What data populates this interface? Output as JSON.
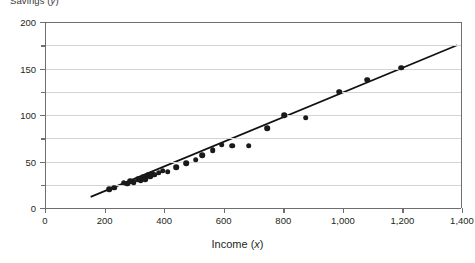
{
  "chart_data": {
    "type": "scatter",
    "title": "Savings (y)",
    "xlabel": "Income",
    "xlabel_var": "x",
    "ylabel": "Savings",
    "ylabel_var": "y",
    "xlim": [
      0,
      1400
    ],
    "ylim": [
      0,
      200
    ],
    "xticks": [
      0,
      200,
      400,
      600,
      800,
      1000,
      1200,
      1400
    ],
    "xticklabels": [
      "0",
      "200",
      "400",
      "600",
      "800",
      "1,000",
      "1,200",
      "1,400"
    ],
    "yticks": [
      0,
      50,
      100,
      150,
      200
    ],
    "yticklabels": [
      "0",
      "50",
      "100",
      "150",
      "200"
    ],
    "yminorticks": [
      25,
      75,
      125,
      175
    ],
    "grid": true,
    "grid_interval": 25,
    "legend": null,
    "marker_color": "#1a1a1a",
    "line_color": "#111111",
    "grid_color": "#d4d4d4",
    "axis_color": "#6f6f6f",
    "points": [
      {
        "x": 213,
        "y": 20
      },
      {
        "x": 228,
        "y": 22
      },
      {
        "x": 261,
        "y": 27
      },
      {
        "x": 272,
        "y": 26
      },
      {
        "x": 283,
        "y": 29
      },
      {
        "x": 295,
        "y": 28
      },
      {
        "x": 308,
        "y": 31
      },
      {
        "x": 318,
        "y": 30
      },
      {
        "x": 326,
        "y": 33
      },
      {
        "x": 333,
        "y": 31
      },
      {
        "x": 341,
        "y": 35
      },
      {
        "x": 349,
        "y": 34
      },
      {
        "x": 356,
        "y": 37
      },
      {
        "x": 364,
        "y": 36
      },
      {
        "x": 378,
        "y": 38
      },
      {
        "x": 392,
        "y": 40
      },
      {
        "x": 408,
        "y": 39
      },
      {
        "x": 437,
        "y": 44
      },
      {
        "x": 470,
        "y": 48
      },
      {
        "x": 503,
        "y": 52
      },
      {
        "x": 525,
        "y": 57
      },
      {
        "x": 560,
        "y": 62
      },
      {
        "x": 590,
        "y": 68
      },
      {
        "x": 625,
        "y": 67
      },
      {
        "x": 681,
        "y": 67
      },
      {
        "x": 742,
        "y": 86
      },
      {
        "x": 800,
        "y": 100
      },
      {
        "x": 872,
        "y": 97
      },
      {
        "x": 985,
        "y": 125
      },
      {
        "x": 1078,
        "y": 138
      },
      {
        "x": 1193,
        "y": 151
      }
    ],
    "fitline": {
      "x0": 150,
      "y0": 12,
      "x1": 1380,
      "y1": 175
    }
  }
}
